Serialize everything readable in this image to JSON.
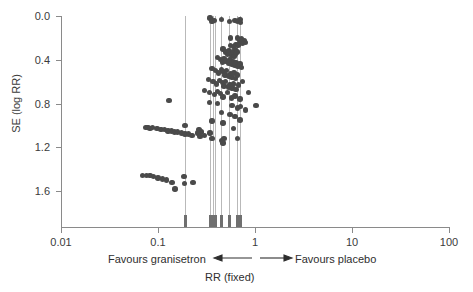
{
  "chart_data": {
    "type": "scatter",
    "title": "",
    "xlabel": "RR (fixed)",
    "ylabel": "SE (log RR)",
    "xscale": "log",
    "xlim": [
      0.01,
      100
    ],
    "ylim": [
      0.0,
      1.8
    ],
    "y_inverted": true,
    "grid": false,
    "legend": null,
    "xticks": [
      "0.01",
      "0.1",
      "1",
      "10",
      "100"
    ],
    "xtick_values": [
      0.01,
      0.1,
      1,
      10,
      100
    ],
    "yticks": [
      "0.0",
      "0.4",
      "0.8",
      "1.2",
      "1.6"
    ],
    "ytick_values": [
      0.0,
      0.4,
      0.8,
      1.2,
      1.6
    ],
    "annotations": {
      "left_label": "Favours granisetron",
      "right_label": "Favours placebo",
      "left_arrow": "left-pointing-arrow",
      "right_arrow": "right-pointing-arrow"
    },
    "reference_lines_rr": [
      0.19,
      0.345,
      0.365,
      0.385,
      0.45,
      0.545,
      0.66,
      0.7
    ],
    "points": [
      [
        0.345,
        0.02
      ],
      [
        0.355,
        0.03
      ],
      [
        0.36,
        0.05
      ],
      [
        0.385,
        0.04
      ],
      [
        0.45,
        0.03
      ],
      [
        0.545,
        0.05
      ],
      [
        0.62,
        0.04
      ],
      [
        0.66,
        0.05
      ],
      [
        0.7,
        0.03
      ],
      [
        0.71,
        0.06
      ],
      [
        0.56,
        0.2
      ],
      [
        0.66,
        0.2
      ],
      [
        0.7,
        0.22
      ],
      [
        0.73,
        0.21
      ],
      [
        0.78,
        0.23
      ],
      [
        0.8,
        0.24
      ],
      [
        0.56,
        0.27
      ],
      [
        0.47,
        0.3
      ],
      [
        0.6,
        0.28
      ],
      [
        0.62,
        0.31
      ],
      [
        0.64,
        0.26
      ],
      [
        0.67,
        0.27
      ],
      [
        0.69,
        0.25
      ],
      [
        0.72,
        0.24
      ],
      [
        0.74,
        0.25
      ],
      [
        0.5,
        0.33
      ],
      [
        0.52,
        0.35
      ],
      [
        0.54,
        0.32
      ],
      [
        0.57,
        0.36
      ],
      [
        0.59,
        0.34
      ],
      [
        0.61,
        0.37
      ],
      [
        0.63,
        0.35
      ],
      [
        0.65,
        0.33
      ],
      [
        0.41,
        0.38
      ],
      [
        0.44,
        0.4
      ],
      [
        0.46,
        0.42
      ],
      [
        0.48,
        0.39
      ],
      [
        0.5,
        0.41
      ],
      [
        0.53,
        0.43
      ],
      [
        0.55,
        0.4
      ],
      [
        0.58,
        0.44
      ],
      [
        0.6,
        0.42
      ],
      [
        0.62,
        0.45
      ],
      [
        0.64,
        0.43
      ],
      [
        0.67,
        0.46
      ],
      [
        0.7,
        0.44
      ],
      [
        0.73,
        0.47
      ],
      [
        0.36,
        0.48
      ],
      [
        0.39,
        0.5
      ],
      [
        0.42,
        0.52
      ],
      [
        0.45,
        0.49
      ],
      [
        0.47,
        0.51
      ],
      [
        0.49,
        0.54
      ],
      [
        0.51,
        0.5
      ],
      [
        0.54,
        0.55
      ],
      [
        0.56,
        0.53
      ],
      [
        0.58,
        0.56
      ],
      [
        0.61,
        0.52
      ],
      [
        0.63,
        0.57
      ],
      [
        0.66,
        0.54
      ],
      [
        0.33,
        0.58
      ],
      [
        0.37,
        0.6
      ],
      [
        0.4,
        0.62
      ],
      [
        0.43,
        0.59
      ],
      [
        0.46,
        0.61
      ],
      [
        0.48,
        0.64
      ],
      [
        0.5,
        0.6
      ],
      [
        0.53,
        0.65
      ],
      [
        0.55,
        0.63
      ],
      [
        0.58,
        0.66
      ],
      [
        0.6,
        0.62
      ],
      [
        0.64,
        0.67
      ],
      [
        0.68,
        0.63
      ],
      [
        0.74,
        0.6
      ],
      [
        0.3,
        0.68
      ],
      [
        0.34,
        0.7
      ],
      [
        0.38,
        0.72
      ],
      [
        0.41,
        0.69
      ],
      [
        0.44,
        0.71
      ],
      [
        0.47,
        0.74
      ],
      [
        0.52,
        0.7
      ],
      [
        0.57,
        0.75
      ],
      [
        0.62,
        0.73
      ],
      [
        0.7,
        0.76
      ],
      [
        0.86,
        0.7
      ],
      [
        0.13,
        0.77
      ],
      [
        0.34,
        0.79
      ],
      [
        0.41,
        0.8
      ],
      [
        0.58,
        0.82
      ],
      [
        0.66,
        0.84
      ],
      [
        0.71,
        0.83
      ],
      [
        0.8,
        0.86
      ],
      [
        1.02,
        0.82
      ],
      [
        0.45,
        0.88
      ],
      [
        0.55,
        0.9
      ],
      [
        0.62,
        0.92
      ],
      [
        0.7,
        0.95
      ],
      [
        0.36,
        0.96
      ],
      [
        0.47,
        0.98
      ],
      [
        0.075,
        1.02
      ],
      [
        0.079,
        1.02
      ],
      [
        0.083,
        1.03
      ],
      [
        0.088,
        1.02
      ],
      [
        0.098,
        1.03
      ],
      [
        0.107,
        1.04
      ],
      [
        0.117,
        1.04
      ],
      [
        0.127,
        1.05
      ],
      [
        0.137,
        1.05
      ],
      [
        0.148,
        1.06
      ],
      [
        0.16,
        1.06
      ],
      [
        0.175,
        1.07
      ],
      [
        0.19,
        1.0
      ],
      [
        0.19,
        1.08
      ],
      [
        0.205,
        1.08
      ],
      [
        0.225,
        1.09
      ],
      [
        0.255,
        1.07
      ],
      [
        0.265,
        1.04
      ],
      [
        0.27,
        1.1
      ],
      [
        0.28,
        1.06
      ],
      [
        0.3,
        1.09
      ],
      [
        0.345,
        1.07
      ],
      [
        0.36,
        1.12
      ],
      [
        0.455,
        1.14
      ],
      [
        0.47,
        1.16
      ],
      [
        0.48,
        1.12
      ],
      [
        0.6,
        1.03
      ],
      [
        0.66,
        1.12
      ],
      [
        0.069,
        1.46
      ],
      [
        0.076,
        1.46
      ],
      [
        0.083,
        1.46
      ],
      [
        0.09,
        1.47
      ],
      [
        0.1,
        1.48
      ],
      [
        0.112,
        1.49
      ],
      [
        0.122,
        1.5
      ],
      [
        0.14,
        1.52
      ],
      [
        0.15,
        1.58
      ],
      [
        0.185,
        1.47
      ],
      [
        0.188,
        1.53
      ],
      [
        0.23,
        1.52
      ]
    ]
  },
  "axes": {
    "y_axis_title": "SE (log RR)",
    "x_axis_title": "RR (fixed)"
  },
  "footer": {
    "favours_left": "Favours granisetron",
    "favours_right": "Favours placebo"
  },
  "colors": {
    "point": "#4a4a4a",
    "axis": "#8a8a8a",
    "reference_line": "#b9b9b9",
    "text": "#2e2e2e"
  }
}
